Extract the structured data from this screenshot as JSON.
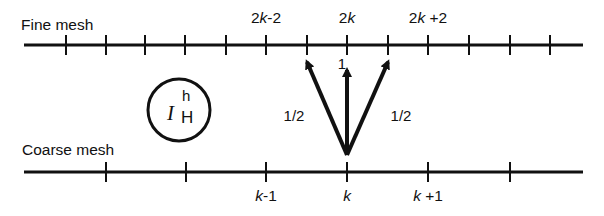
{
  "figure": {
    "fine_mesh": {
      "title": "Fine mesh",
      "line": {
        "y": 45,
        "x_start": 24,
        "x_end": 583
      },
      "ticks_x": [
        66,
        106,
        145,
        185,
        226,
        266,
        307,
        347,
        388,
        428,
        469,
        510,
        550
      ],
      "labels": [
        {
          "text": "2k-2",
          "prefix": "2",
          "var": "k",
          "suffix": "-2",
          "x": 266
        },
        {
          "text": "2k",
          "prefix": "2",
          "var": "k",
          "suffix": "",
          "x": 347
        },
        {
          "text": "2k+2",
          "prefix": "2",
          "var": "k",
          "suffix": "+2",
          "x": 428
        }
      ]
    },
    "coarse_mesh": {
      "title": "Coarse mesh",
      "line": {
        "y": 172,
        "x_start": 24,
        "x_end": 583
      },
      "ticks_x": [
        106,
        186,
        266,
        347,
        428,
        510
      ],
      "labels": [
        {
          "text": "k-1",
          "prefix": "",
          "var": "k",
          "suffix": "-1",
          "x": 266
        },
        {
          "text": "k",
          "prefix": "",
          "var": "k",
          "suffix": "",
          "x": 347
        },
        {
          "text": "k+1",
          "prefix": "",
          "var": "k",
          "suffix": "+1",
          "x": 428
        }
      ]
    },
    "operator": {
      "symbol": "I",
      "superscript": "h",
      "subscript": "H"
    },
    "arrows": [
      {
        "from": [
          347,
          155
        ],
        "to": [
          307,
          62
        ],
        "weight": "1/2",
        "label_x": 294,
        "label_y": 108
      },
      {
        "from": [
          347,
          155
        ],
        "to": [
          347,
          70
        ],
        "weight": "1",
        "label_x": 342,
        "label_y": 56
      },
      {
        "from": [
          347,
          155
        ],
        "to": [
          388,
          62
        ],
        "weight": "1/2",
        "label_x": 401,
        "label_y": 108
      }
    ],
    "colors": {
      "ink": "#111111",
      "background": "#ffffff"
    }
  }
}
